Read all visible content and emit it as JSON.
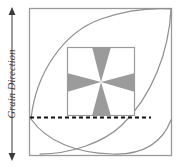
{
  "figure": {
    "axis_label": "Grain Direction",
    "arrow_icon_top": "arrow-up-icon",
    "arrow_icon_bottom": "arrow-down-icon",
    "outer_square_label": "outer-square",
    "inner_square_label": "inner-square",
    "curve_upper_label": "upper-deformation-curve",
    "curve_lower_label": "lower-deformation-curve",
    "dashed_line_label": "reference-dashed-line",
    "star_label": "four-point-star"
  },
  "colors": {
    "outline": "#9a9a9a",
    "inner_outline": "#9a9a9a",
    "curve": "#8f8f8f",
    "star_fill": "#9b9b9b",
    "dashed": "#111111",
    "axis_line": "#4a4a4a",
    "text": "#3a3a3a",
    "background": "#ffffff"
  },
  "geometry": {
    "outer_square": {
      "x": 29,
      "y": 8,
      "w": 143,
      "h": 148
    },
    "inner_square": {
      "x": 67,
      "y": 47,
      "w": 68,
      "h": 69
    },
    "star_center": {
      "x": 101,
      "y": 82
    },
    "dashed_line_y": 117,
    "dashed_line_x1": 30,
    "dashed_line_x2": 151,
    "axis_x": 12,
    "axis_y1": 10,
    "axis_y2": 158
  }
}
